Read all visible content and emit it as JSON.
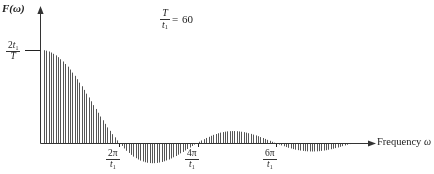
{
  "figure": {
    "y_axis_label": "F(ω)",
    "x_axis_label": "Frequency",
    "x_axis_label_symbol": "ω",
    "y_value_label": {
      "numerator_prefix": "2",
      "numerator_var": "t",
      "numerator_sub": "1",
      "denominator": "T"
    },
    "annotation": {
      "numerator": "T",
      "denominator_var": "t",
      "denominator_sub": "1",
      "operator": "=",
      "value": "60"
    },
    "ticks": [
      {
        "numerator": "2π",
        "denominator_var": "t",
        "denominator_sub": "1"
      },
      {
        "numerator": "4π",
        "denominator_var": "t",
        "denominator_sub": "1"
      },
      {
        "numerator": "6π",
        "denominator_var": "t",
        "denominator_sub": "1"
      }
    ],
    "colors": {
      "ink": "#222222",
      "line": "#555555",
      "axis": "#333333"
    }
  },
  "chart_data": {
    "type": "line",
    "plot_style": "discrete-spectral-lines",
    "title": "",
    "xlabel": "Frequency ω",
    "ylabel": "F(ω)",
    "annotation": "T/t1 = 60",
    "parameter_T_over_t1": 60,
    "envelope_function": "sinc",
    "peak_value_label": "2t1/T",
    "peak_value_pixels": 93,
    "line_count": 140,
    "line_spacing_px": 2.35,
    "axis_origin_px": {
      "x": 41,
      "y": 143
    },
    "axis_end_px": {
      "x": 372,
      "y": 143
    },
    "y_axis_top_px": 8,
    "grid": false,
    "legend": false,
    "xlim": [
      0,
      8.6
    ],
    "ylim": [
      -0.22,
      1.0
    ],
    "xtick_values": [
      2,
      4,
      6
    ],
    "xtick_labels": [
      "2π/t1",
      "4π/t1",
      "6π/t1"
    ],
    "xtick_pixels": [
      119,
      198,
      276
    ],
    "zero_crossings_px": [
      119,
      198,
      276,
      355
    ],
    "lobes": [
      {
        "index": 0,
        "sign": "positive",
        "start_px": 41,
        "end_px": 119,
        "peak_px": 44,
        "peak_height_px": 93
      },
      {
        "index": 1,
        "sign": "negative",
        "start_px": 119,
        "end_px": 198,
        "peak_px": 159,
        "peak_height_px": -20
      },
      {
        "index": 2,
        "sign": "positive",
        "start_px": 198,
        "end_px": 276,
        "peak_px": 237,
        "peak_height_px": 12
      },
      {
        "index": 3,
        "sign": "negative",
        "start_px": 276,
        "end_px": 355,
        "peak_px": 316,
        "peak_height_px": -8
      }
    ],
    "series": [
      {
        "name": "|F(ω)| spectral lines",
        "x": [
          0.0,
          0.12,
          0.25,
          0.37,
          0.5,
          0.62,
          0.74,
          0.87,
          0.99,
          1.12,
          1.24,
          1.36,
          1.49,
          1.61,
          1.74,
          1.86,
          1.98,
          2.11,
          2.23,
          2.36,
          2.48,
          2.6,
          2.73,
          2.85,
          2.98,
          3.1,
          3.22,
          3.35,
          3.47,
          3.6,
          3.72,
          3.84,
          3.97,
          4.09,
          4.22,
          4.34,
          4.46,
          4.59,
          4.71,
          4.84,
          4.96,
          5.08,
          5.21,
          5.33,
          5.46,
          5.58,
          5.7,
          5.83,
          5.95,
          6.08,
          6.2,
          6.32,
          6.45,
          6.57,
          6.7,
          6.82,
          6.94,
          7.07,
          7.19,
          7.32,
          7.44,
          7.56,
          7.69,
          7.81,
          7.94,
          8.06,
          8.18,
          8.31,
          8.43,
          8.56
        ],
        "values": [
          1.0,
          0.998,
          0.99,
          0.977,
          0.959,
          0.936,
          0.908,
          0.875,
          0.838,
          0.797,
          0.752,
          0.704,
          0.653,
          0.6,
          0.545,
          0.488,
          0.431,
          0.373,
          0.315,
          0.258,
          0.202,
          0.147,
          0.094,
          0.044,
          -0.003,
          -0.047,
          -0.087,
          -0.123,
          -0.154,
          -0.18,
          -0.2,
          -0.215,
          -0.224,
          -0.227,
          -0.225,
          -0.217,
          -0.204,
          -0.187,
          -0.166,
          -0.141,
          -0.113,
          -0.083,
          -0.052,
          -0.02,
          0.012,
          0.043,
          0.072,
          0.099,
          0.122,
          0.141,
          0.156,
          0.166,
          0.171,
          0.171,
          0.166,
          0.157,
          0.143,
          0.126,
          0.105,
          0.082,
          0.058,
          0.033,
          0.008,
          -0.017,
          -0.04,
          -0.061,
          -0.079,
          -0.094,
          -0.105,
          -0.112
        ]
      }
    ]
  }
}
